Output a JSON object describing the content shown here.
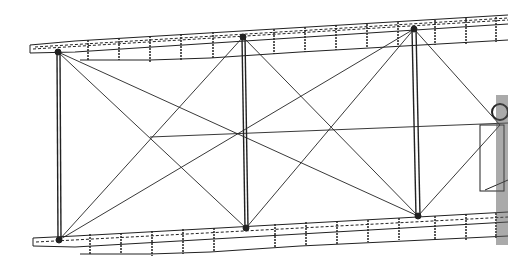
{
  "diagram": {
    "subject": "Biplane wing bay structure line drawing",
    "background": "#ffffff",
    "line_color": "#222222",
    "upper_wing": {
      "left_tip": [
        30,
        48
      ],
      "right_end": [
        508,
        20
      ]
    },
    "lower_wing": {
      "left_tip": [
        33,
        242
      ],
      "right_end": [
        508,
        218
      ]
    },
    "struts": [
      {
        "top": [
          58,
          52
        ],
        "bottom": [
          59,
          240
        ]
      },
      {
        "top": [
          243,
          37
        ],
        "bottom": [
          246,
          228
        ]
      },
      {
        "top": [
          414,
          29
        ],
        "bottom": [
          418,
          216
        ]
      }
    ],
    "bracing_wires": [
      [
        [
          58,
          52
        ],
        [
          246,
          228
        ]
      ],
      [
        [
          243,
          37
        ],
        [
          59,
          240
        ]
      ],
      [
        [
          58,
          52
        ],
        [
          418,
          216
        ]
      ],
      [
        [
          414,
          29
        ],
        [
          59,
          240
        ]
      ],
      [
        [
          243,
          37
        ],
        [
          418,
          216
        ]
      ],
      [
        [
          414,
          29
        ],
        [
          246,
          228
        ]
      ]
    ]
  }
}
